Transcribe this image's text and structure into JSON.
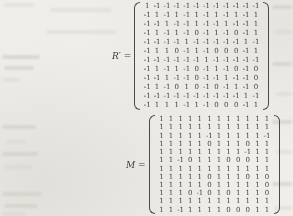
{
  "page": {
    "kind": "scanned math page"
  },
  "matrices": [
    {
      "name": "R-prime",
      "label": "R′ =",
      "rows": [
        [
          "1",
          "-1",
          "-1",
          "-1",
          "-1",
          "-1",
          "-1",
          "-1",
          "-1",
          "-1",
          "-1",
          "-1"
        ],
        [
          "-1",
          "1",
          "-1",
          "1",
          "-1",
          "1",
          "-1",
          "1",
          "-1",
          "1",
          "-1",
          "1"
        ],
        [
          "-1",
          "-1",
          "1",
          "-1",
          "-1",
          "1",
          "-1",
          "-1",
          "1",
          "-1",
          "-1",
          "1"
        ],
        [
          "-1",
          "1",
          "-1",
          "1",
          "-1",
          "0",
          "-1",
          "1",
          "-1",
          "0",
          "-1",
          "1"
        ],
        [
          "-1",
          "-1",
          "-1",
          "-1",
          "1",
          "-1",
          "-1",
          "-1",
          "-1",
          "-1",
          "1",
          "-1"
        ],
        [
          "-1",
          "1",
          "1",
          "0",
          "-1",
          "1",
          "-1",
          "0",
          "0",
          "0",
          "-1",
          "1"
        ],
        [
          "-1",
          "-1",
          "-1",
          "-1",
          "-1",
          "-1",
          "1",
          "-1",
          "-1",
          "-1",
          "-1",
          "-1"
        ],
        [
          "-1",
          "1",
          "-1",
          "1",
          "-1",
          "0",
          "-1",
          "1",
          "-1",
          "0",
          "-1",
          "0"
        ],
        [
          "-1",
          "-1",
          "1",
          "-1",
          "-1",
          "0",
          "-1",
          "-1",
          "1",
          "-1",
          "-1",
          "0"
        ],
        [
          "-1",
          "1",
          "-1",
          "0",
          "1",
          "0",
          "-1",
          "0",
          "-1",
          "1",
          "-1",
          "0"
        ],
        [
          "-1",
          "-1",
          "-1",
          "-1",
          "-1",
          "-1",
          "-1",
          "-1",
          "-1",
          "-1",
          "1",
          "-1"
        ],
        [
          "-1",
          "1",
          "1",
          "1",
          "-1",
          "1",
          "-1",
          "0",
          "0",
          "0",
          "-1",
          "1"
        ]
      ]
    },
    {
      "name": "M",
      "label": "M =",
      "rows": [
        [
          "1",
          "1",
          "1",
          "1",
          "1",
          "1",
          "1",
          "1",
          "1",
          "1",
          "1",
          "1"
        ],
        [
          "1",
          "1",
          "1",
          "1",
          "1",
          "1",
          "1",
          "1",
          "1",
          "1",
          "1",
          "1"
        ],
        [
          "1",
          "1",
          "1",
          "1",
          "1",
          "-1",
          "1",
          "1",
          "1",
          "1",
          "1",
          "-1"
        ],
        [
          "1",
          "1",
          "1",
          "1",
          "1",
          "0",
          "1",
          "1",
          "1",
          "0",
          "1",
          "1"
        ],
        [
          "1",
          "1",
          "1",
          "1",
          "1",
          "1",
          "1",
          "1",
          "1",
          "-1",
          "1",
          "1"
        ],
        [
          "1",
          "1",
          "-1",
          "0",
          "1",
          "1",
          "1",
          "0",
          "0",
          "0",
          "1",
          "1"
        ],
        [
          "1",
          "1",
          "1",
          "1",
          "1",
          "1",
          "1",
          "1",
          "1",
          "1",
          "1",
          "1"
        ],
        [
          "1",
          "1",
          "1",
          "1",
          "1",
          "0",
          "1",
          "1",
          "1",
          "0",
          "1",
          "0"
        ],
        [
          "1",
          "1",
          "1",
          "1",
          "1",
          "0",
          "1",
          "1",
          "1",
          "1",
          "1",
          "0"
        ],
        [
          "1",
          "1",
          "1",
          "0",
          "-1",
          "0",
          "1",
          "0",
          "1",
          "1",
          "1",
          "0"
        ],
        [
          "1",
          "1",
          "1",
          "1",
          "1",
          "1",
          "1",
          "1",
          "1",
          "1",
          "1",
          "1"
        ],
        [
          "1",
          "1",
          "-1",
          "1",
          "1",
          "1",
          "1",
          "0",
          "0",
          "0",
          "1",
          "1"
        ]
      ]
    }
  ]
}
